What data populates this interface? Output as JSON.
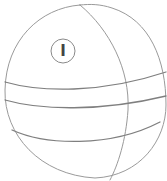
{
  "figure": {
    "label": "I",
    "stroke_color": "#9a9a9a",
    "band_color": "#7f7f7f",
    "label_color": "#444444"
  }
}
